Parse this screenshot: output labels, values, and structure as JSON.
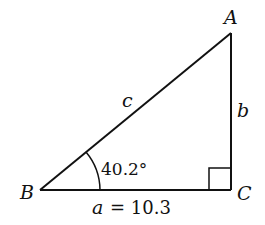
{
  "diagram": {
    "type": "right-triangle",
    "vertices": {
      "A": {
        "label": "A"
      },
      "B": {
        "label": "B"
      },
      "C": {
        "label": "C"
      }
    },
    "sides": {
      "a": {
        "label": "a",
        "value_text": "= 10.3"
      },
      "b": {
        "label": "b"
      },
      "c": {
        "label": "c"
      }
    },
    "angle_B": {
      "text": "40.2°"
    },
    "right_angle_at": "C",
    "colors": {
      "stroke": "#111111",
      "background": "#ffffff"
    }
  }
}
